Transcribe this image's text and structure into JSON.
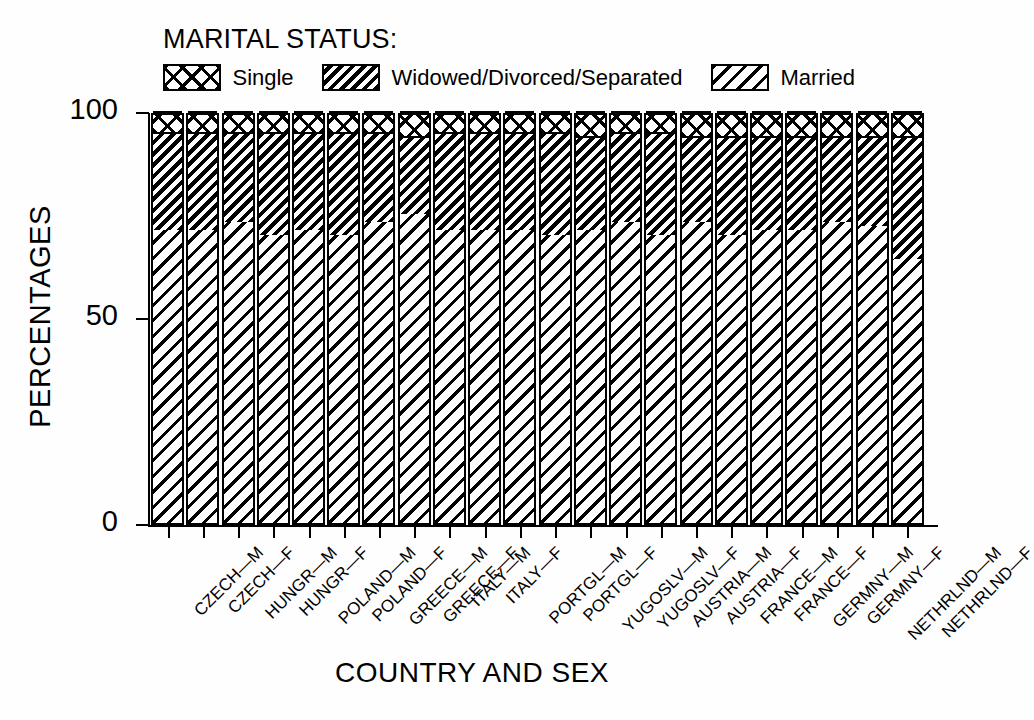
{
  "legend": {
    "title": "MARITAL STATUS:",
    "items": [
      {
        "label": "Single",
        "pattern": "cross-hatch"
      },
      {
        "label": "Widowed/Divorced/Separated",
        "pattern": "dense-diagonal-black"
      },
      {
        "label": "Married",
        "pattern": "sparse-diagonal"
      }
    ]
  },
  "axes": {
    "ylabel": "PERCENTAGES",
    "xlabel": "COUNTRY AND SEX",
    "yticks": [
      "0",
      "50",
      "100"
    ]
  },
  "chart_data": {
    "type": "bar",
    "title": "MARITAL STATUS:",
    "xlabel": "COUNTRY AND SEX",
    "ylabel": "PERCENTAGES",
    "ylim": [
      0,
      100
    ],
    "ytick_values": [
      0,
      50,
      100
    ],
    "grid": false,
    "stacked": true,
    "legend_position": "top",
    "categories": [
      "CZECH—M",
      "CZECH—F",
      "HUNGR—M",
      "HUNGR—F",
      "POLAND—M",
      "POLAND—F",
      "GREECE—M",
      "GREECE—F",
      "ITALY—M",
      "ITALY—F",
      "PORTGL—M",
      "PORTGL—F",
      "YUGOSLV—M",
      "YUGOSLV—F",
      "AUSTRIA—M",
      "AUSTRIA—F",
      "FRANCE—M",
      "FRANCE—F",
      "GERMNY—M",
      "GERMNY—F",
      "NETHRLND—M",
      "NETHRLND—F"
    ],
    "series": [
      {
        "name": "Married",
        "values": [
          71,
          71,
          73,
          70,
          71,
          70,
          73,
          75,
          71,
          71,
          71,
          70,
          71,
          73,
          70,
          73,
          70,
          71,
          71,
          73,
          72,
          64
        ]
      },
      {
        "name": "Widowed/Divorced/Separated",
        "values": [
          24,
          24,
          22,
          25,
          24,
          25,
          22,
          19,
          24,
          24,
          24,
          25,
          23,
          22,
          25,
          21,
          24,
          23,
          23,
          21,
          22,
          30
        ]
      },
      {
        "name": "Single",
        "values": [
          5,
          5,
          5,
          5,
          5,
          5,
          5,
          6,
          5,
          5,
          5,
          5,
          6,
          5,
          5,
          6,
          6,
          6,
          6,
          6,
          6,
          6
        ]
      }
    ]
  }
}
